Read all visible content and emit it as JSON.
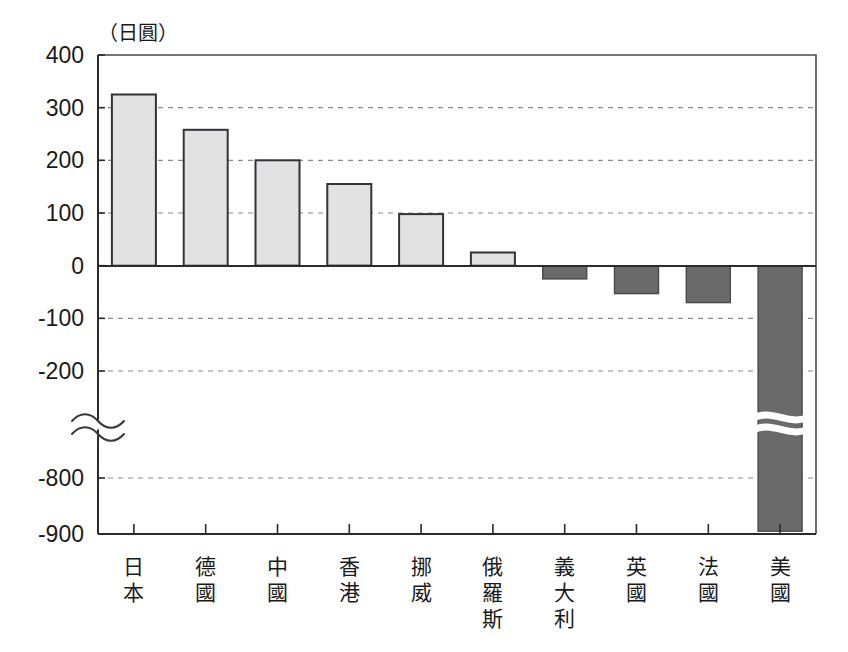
{
  "chart_data": {
    "type": "bar",
    "title": "",
    "unit_label": "（日圓）",
    "xlabel": "",
    "ylabel": "",
    "categories": [
      "日本",
      "德國",
      "中國",
      "香港",
      "挪威",
      "俄羅斯",
      "義大利",
      "英國",
      "法國",
      "美國"
    ],
    "values": [
      325,
      258,
      200,
      155,
      98,
      25,
      -25,
      -53,
      -70,
      -895
    ],
    "ytick_labels": [
      "400",
      "300",
      "200",
      "100",
      "0",
      "-100",
      "-200",
      "-800",
      "-900"
    ],
    "ytick_values": [
      400,
      300,
      200,
      100,
      0,
      -100,
      -200,
      -800,
      -900
    ],
    "ylim": [
      -900,
      400
    ],
    "axis_break": true,
    "axis_break_between": [
      -200,
      -800
    ],
    "grid": true,
    "grid_axis": "y",
    "legend": "none",
    "colors": {
      "positive_fill": "#e2e2e2",
      "positive_stroke": "#33333a",
      "negative_fill": "#6a6a6a",
      "negative_stroke": "#4a4a4a",
      "gridline": "#8a8a8a",
      "axis": "#2b2b2b",
      "background": "#ffffff"
    }
  }
}
